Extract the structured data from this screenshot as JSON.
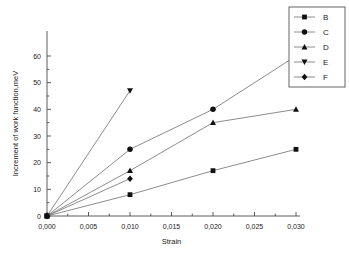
{
  "chart_data": {
    "type": "line",
    "title": "",
    "xlabel": "Strain",
    "ylabel": "Increment of work function,meV",
    "xlim": [
      0.0,
      0.03
    ],
    "ylim": [
      0,
      60
    ],
    "grid": false,
    "legend_position": "top-right",
    "x_tick_labels": [
      "0,000",
      "0,005",
      "0,010",
      "0,015",
      "0,020",
      "0,025",
      "0,030"
    ],
    "x_tick_values": [
      0.0,
      0.005,
      0.01,
      0.015,
      0.02,
      0.025,
      0.03
    ],
    "y_tick_labels": [
      "0",
      "10",
      "20",
      "30",
      "40",
      "50",
      "60"
    ],
    "y_tick_values": [
      0,
      10,
      20,
      30,
      40,
      50,
      60
    ],
    "series": [
      {
        "name": "B",
        "marker": "square",
        "x": [
          0.0,
          0.01,
          0.02,
          0.03
        ],
        "values": [
          0,
          8,
          17,
          25
        ]
      },
      {
        "name": "C",
        "marker": "circle",
        "x": [
          0.0,
          0.01,
          0.02,
          0.03
        ],
        "values": [
          0,
          25,
          40,
          60
        ]
      },
      {
        "name": "D",
        "marker": "triangle-up",
        "x": [
          0.0,
          0.01,
          0.02,
          0.03
        ],
        "values": [
          0,
          17,
          35,
          40
        ]
      },
      {
        "name": "E",
        "marker": "triangle-down",
        "x": [
          0.0,
          0.01
        ],
        "values": [
          0,
          47
        ]
      },
      {
        "name": "F",
        "marker": "diamond",
        "x": [
          0.0,
          0.01
        ],
        "values": [
          0,
          14
        ]
      }
    ]
  },
  "legend": {
    "entries": [
      {
        "label": "B",
        "marker": "square"
      },
      {
        "label": "C",
        "marker": "circle"
      },
      {
        "label": "D",
        "marker": "triangle-up"
      },
      {
        "label": "E",
        "marker": "triangle-down"
      },
      {
        "label": "F",
        "marker": "diamond"
      }
    ]
  },
  "colors": {
    "background": "#ffffff",
    "axis": "#4a4a4a",
    "line": "#6e6e6e",
    "marker": "#111111",
    "legend_border": "#555555",
    "text": "#1a1a1a"
  }
}
